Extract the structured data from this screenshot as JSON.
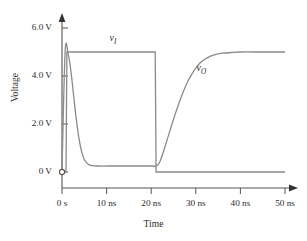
{
  "chart_data": {
    "type": "line",
    "title": "",
    "xlabel": "Time",
    "ylabel": "Voltage",
    "xlim": [
      0,
      50
    ],
    "ylim": [
      0,
      6.6
    ],
    "grid": false,
    "legend_position": "inline-annotations",
    "x_unit": "ns",
    "y_unit": "V",
    "x_tick_values": [
      0,
      10,
      20,
      30,
      40,
      50
    ],
    "x_tick_labels": [
      "0 s",
      "10 ns",
      "20 ns",
      "30 ns",
      "40 ns",
      "50 ns"
    ],
    "y_tick_values": [
      0,
      2,
      4,
      6
    ],
    "y_tick_labels": [
      "0 V",
      "2.0 V",
      "4.0 V",
      "6.0 V"
    ],
    "series": [
      {
        "name": "vI",
        "label": "v",
        "label_sub": "I",
        "description": "input square pulse, rises to 5.0 V at ~1 ns and falls to 0 V at ~21 ns",
        "color": "#8a8a8a",
        "points": [
          [
            0.0,
            0.0
          ],
          [
            0.9,
            0.0
          ],
          [
            1.1,
            5.0
          ],
          [
            20.9,
            5.0
          ],
          [
            21.1,
            0.0
          ],
          [
            50.0,
            0.0
          ]
        ]
      },
      {
        "name": "vO",
        "label": "v",
        "label_sub": "O",
        "description": "inverter output, starts at 5.0 V, falls to ~0.25 V by ~6 ns, rises back toward 5.0 V after 21 ns with RC settling",
        "color": "#8a8a8a",
        "points": [
          [
            0.0,
            0.0
          ],
          [
            0.7,
            5.0
          ],
          [
            1.4,
            4.9
          ],
          [
            2.0,
            4.2
          ],
          [
            2.6,
            3.2
          ],
          [
            3.2,
            2.2
          ],
          [
            3.8,
            1.4
          ],
          [
            4.4,
            0.85
          ],
          [
            5.0,
            0.52
          ],
          [
            5.8,
            0.33
          ],
          [
            6.6,
            0.27
          ],
          [
            8.0,
            0.25
          ],
          [
            12.0,
            0.25
          ],
          [
            16.0,
            0.25
          ],
          [
            20.0,
            0.25
          ],
          [
            21.2,
            0.25
          ],
          [
            22.0,
            0.45
          ],
          [
            23.0,
            1.0
          ],
          [
            24.0,
            1.6
          ],
          [
            25.0,
            2.2
          ],
          [
            26.0,
            2.75
          ],
          [
            27.0,
            3.25
          ],
          [
            28.0,
            3.7
          ],
          [
            29.0,
            4.05
          ],
          [
            30.0,
            4.33
          ],
          [
            31.0,
            4.55
          ],
          [
            32.0,
            4.7
          ],
          [
            33.0,
            4.8
          ],
          [
            34.0,
            4.87
          ],
          [
            35.0,
            4.92
          ],
          [
            36.0,
            4.95
          ],
          [
            38.0,
            4.98
          ],
          [
            40.0,
            5.0
          ],
          [
            45.0,
            5.0
          ],
          [
            50.0,
            5.0
          ]
        ]
      }
    ],
    "annotations": [
      {
        "text": "v",
        "sub": "I",
        "x": 12.0,
        "y": 5.55
      },
      {
        "text": "v",
        "sub": "O",
        "x": 31.5,
        "y": 4.3
      }
    ]
  },
  "axes": {
    "origin_marker": "open-circle",
    "axis_color": "#555555",
    "curve_color": "#8a8a8a",
    "arrow_heads": [
      "x-axis-right",
      "y-axis-top"
    ]
  },
  "ylabel_text": "Voltage",
  "xlabel_text": "Time"
}
